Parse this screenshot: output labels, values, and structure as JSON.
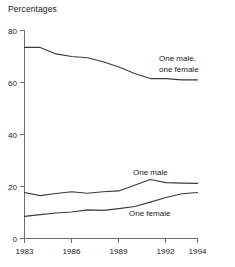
{
  "chart_data": {
    "type": "line",
    "title": "Percentages",
    "xlabel": "",
    "ylabel": "",
    "xlim": [
      1983,
      1994
    ],
    "ylim": [
      0,
      80
    ],
    "grid": false,
    "legend_position": "inline-annotations",
    "x": [
      1983,
      1984,
      1985,
      1986,
      1987,
      1988,
      1989,
      1990,
      1991,
      1992,
      1993,
      1994
    ],
    "x_tick_labels": [
      "1983",
      "1986",
      "1989",
      "1992",
      "1994"
    ],
    "x_tick_values": [
      1983,
      1986,
      1989,
      1992,
      1994
    ],
    "y_tick_labels": [
      "0",
      "20",
      "40",
      "60",
      "80"
    ],
    "y_tick_values": [
      0,
      20,
      40,
      60,
      80
    ],
    "series": [
      {
        "name": "One male, one female",
        "label_line1": "One male,",
        "label_line2": "one female",
        "values": [
          73.5,
          73.5,
          71.0,
          70.0,
          69.5,
          68.0,
          66.0,
          63.5,
          61.5,
          61.5,
          61.0,
          61.0
        ]
      },
      {
        "name": "One male",
        "label_line1": "One male",
        "label_line2": "",
        "values": [
          17.7,
          16.5,
          17.3,
          18.0,
          17.4,
          18.0,
          18.3,
          20.5,
          22.7,
          21.5,
          21.3,
          21.2
        ]
      },
      {
        "name": "One female",
        "label_line1": "One female",
        "label_line2": "",
        "values": [
          8.5,
          9.2,
          9.8,
          10.2,
          11.0,
          10.8,
          11.5,
          12.3,
          14.0,
          15.8,
          17.2,
          17.7
        ]
      }
    ]
  },
  "axis": {
    "y_0": "0",
    "y_20": "20",
    "y_40": "40",
    "y_60": "60",
    "y_80": "80",
    "x_1983": "1983",
    "x_1986": "1986",
    "x_1989": "1989",
    "x_1992": "1992",
    "x_1994": "1994"
  },
  "annotations": {
    "top_line1": "One male,",
    "top_line2": "one female",
    "mid": "One male",
    "low": "One female"
  },
  "colors": {
    "line": "#3b3b3b",
    "axis": "#6e6e6e",
    "text": "#1a1a1a",
    "background": "#ffffff"
  }
}
